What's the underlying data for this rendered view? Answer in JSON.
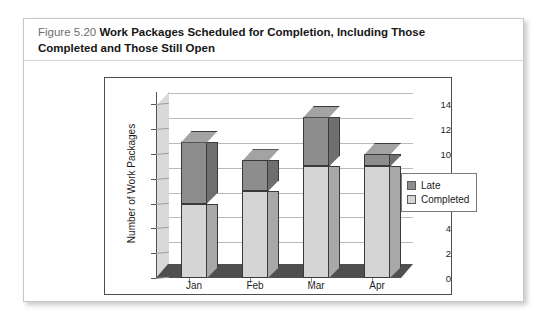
{
  "figure": {
    "number": "Figure 5.20",
    "title_line1": "Work Packages Scheduled for Completion, Including Those",
    "title_line2": "Completed and Those Still Open"
  },
  "chart_data": {
    "type": "bar",
    "subtype": "stacked-3d-column",
    "title": "",
    "xlabel": "",
    "ylabel": "Number of Work Packages",
    "categories": [
      "Jan",
      "Feb",
      "Mar",
      "Apr"
    ],
    "ylim": [
      0,
      15
    ],
    "yticks": [
      0,
      2,
      4,
      6,
      8,
      10,
      12,
      14
    ],
    "ytick_labels": [
      "0",
      "2",
      "4",
      "6",
      "8",
      "10",
      "12",
      "14"
    ],
    "grid": true,
    "legend_position": "right",
    "series": [
      {
        "name": "Completed",
        "color": "#d5d5d5",
        "side_color": "#a8a8a8",
        "top_color": "#e4e4e4",
        "values": [
          6,
          7,
          9,
          9
        ]
      },
      {
        "name": "Late",
        "color": "#8d8d8d",
        "side_color": "#6f6f6f",
        "top_color": "#a3a3a3",
        "values": [
          5,
          2.5,
          4,
          1
        ]
      }
    ],
    "totals": [
      11,
      9.5,
      13,
      10
    ]
  },
  "legend": {
    "items": [
      {
        "label": "Late",
        "color": "#8d8d8d"
      },
      {
        "label": "Completed",
        "color": "#d5d5d5"
      }
    ]
  },
  "colors": {
    "wall": "#d9d9d9",
    "floor": "#4f4f4f",
    "gridline": "#b9b9b9",
    "frame_border": "#4d4d4d",
    "card_border": "#c9c9c9"
  }
}
